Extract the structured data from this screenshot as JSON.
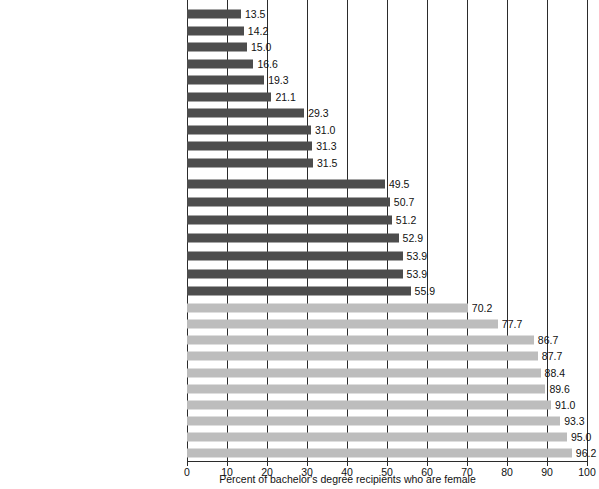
{
  "chart_data": {
    "type": "bar",
    "orientation": "horizontal",
    "title": "",
    "subtitle": "",
    "xlabel": "Percent of bachelor's degree recipients who are female",
    "ylabel": "",
    "xlim": [
      0,
      100
    ],
    "xticks": [
      0,
      10,
      20,
      30,
      40,
      50,
      60,
      70,
      80,
      90,
      100
    ],
    "xtick_labels": [
      "0",
      "10",
      "20",
      "30",
      "40",
      "50",
      "60",
      "70",
      "80",
      "90",
      "100"
    ],
    "grid": true,
    "grid_axis": "x",
    "legend": "none",
    "colors": {
      "dark_bar": "#4d4d4d",
      "light_bar": "#bdbdbd",
      "gridline": "#2b2b2b",
      "text": "#111111",
      "background": "#ffffff"
    },
    "groups": [
      {
        "name": "male-dominated",
        "color": "dark_bar",
        "categories": [
          "Mechanical engineering",
          "Aerospace engineering",
          "Jazz/Jazz studies",
          "Computer science",
          "Physics",
          "Music theory and composition",
          "Finance",
          "Astrophysics",
          "Economics",
          "Philosophy"
        ],
        "values": [
          13.5,
          14.2,
          15.0,
          16.6,
          19.3,
          21.1,
          29.3,
          31.0,
          31.3,
          31.5
        ],
        "value_labels": [
          "13.5",
          "14.2",
          "15.0",
          "16.6",
          "19.3",
          "21.1",
          "29.3",
          "31.0",
          "31.3",
          "31.5"
        ]
      },
      {
        "name": "near-balanced",
        "color": "dark_bar",
        "categories": [
          "Biochemistry",
          "Accounting",
          "Environmental science",
          "Criminology",
          "Kinesiology and exercise science",
          "Parks, recreation, and leisure studies",
          "Music teacher education"
        ],
        "values": [
          49.5,
          50.7,
          51.2,
          52.9,
          53.9,
          53.9,
          55.9
        ],
        "value_labels": [
          "49.5",
          "50.7",
          "51.2",
          "52.9",
          "53.9",
          "53.9",
          "55.9"
        ]
      },
      {
        "name": "female-dominated",
        "color": "light_bar",
        "categories": [
          "Sociology",
          "Psychology",
          "Art history",
          "Registered nursing",
          "Social work",
          "Interior design",
          "Elementary education",
          "Women's studies",
          "Family and consumer sciences",
          "Early childhood education"
        ],
        "values": [
          70.2,
          77.7,
          86.7,
          87.7,
          88.4,
          89.6,
          91.0,
          93.3,
          95.0,
          96.2
        ],
        "value_labels": [
          "70.2",
          "77.7",
          "86.7",
          "87.7",
          "88.4",
          "89.6",
          "91.0",
          "93.3",
          "95.0",
          "96.2"
        ]
      }
    ]
  }
}
